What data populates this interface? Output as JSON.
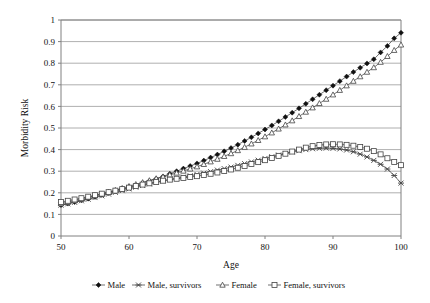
{
  "chart_data": {
    "type": "line",
    "title": "",
    "xlabel": "Age",
    "ylabel": "Morbidity Risk",
    "xlim": [
      50,
      100
    ],
    "ylim": [
      0,
      1
    ],
    "xticks": [
      50,
      60,
      70,
      80,
      90,
      100
    ],
    "yticks": [
      0,
      0.1,
      0.2,
      0.3,
      0.4,
      0.5,
      0.6,
      0.7,
      0.8,
      0.9,
      1
    ],
    "xtick_labels": [
      "50",
      "60",
      "70",
      "80",
      "90",
      "100"
    ],
    "ytick_labels": [
      "0",
      "0.1",
      "0.2",
      "0.3",
      "0.4",
      "0.5",
      "0.6",
      "0.7",
      "0.8",
      "0.9",
      "1"
    ],
    "grid": "horizontal",
    "legend_position": "bottom",
    "x": [
      50,
      51,
      52,
      53,
      54,
      55,
      56,
      57,
      58,
      59,
      60,
      61,
      62,
      63,
      64,
      65,
      66,
      67,
      68,
      69,
      70,
      71,
      72,
      73,
      74,
      75,
      76,
      77,
      78,
      79,
      80,
      81,
      82,
      83,
      84,
      85,
      86,
      87,
      88,
      89,
      90,
      91,
      92,
      93,
      94,
      95,
      96,
      97,
      98,
      99,
      100
    ],
    "series": [
      {
        "name": "Male",
        "marker": "filled-diamond",
        "values": [
          0.143,
          0.15,
          0.157,
          0.165,
          0.173,
          0.181,
          0.19,
          0.199,
          0.208,
          0.217,
          0.226,
          0.235,
          0.245,
          0.255,
          0.265,
          0.276,
          0.288,
          0.3,
          0.312,
          0.324,
          0.336,
          0.349,
          0.363,
          0.377,
          0.392,
          0.407,
          0.423,
          0.44,
          0.457,
          0.475,
          0.493,
          0.512,
          0.531,
          0.551,
          0.571,
          0.591,
          0.612,
          0.633,
          0.654,
          0.675,
          0.696,
          0.717,
          0.738,
          0.759,
          0.779,
          0.799,
          0.818,
          0.85,
          0.88,
          0.915,
          0.941
        ]
      },
      {
        "name": "Male, survivors",
        "marker": "cross",
        "values": [
          0.143,
          0.149,
          0.156,
          0.163,
          0.17,
          0.178,
          0.186,
          0.194,
          0.202,
          0.21,
          0.218,
          0.226,
          0.234,
          0.241,
          0.248,
          0.255,
          0.261,
          0.267,
          0.273,
          0.279,
          0.285,
          0.291,
          0.298,
          0.305,
          0.312,
          0.319,
          0.327,
          0.335,
          0.343,
          0.351,
          0.359,
          0.367,
          0.375,
          0.382,
          0.389,
          0.395,
          0.4,
          0.404,
          0.406,
          0.407,
          0.406,
          0.403,
          0.398,
          0.39,
          0.379,
          0.366,
          0.35,
          0.332,
          0.31,
          0.28,
          0.245
        ]
      },
      {
        "name": "Female",
        "marker": "open-triangle",
        "values": [
          0.15,
          0.157,
          0.164,
          0.171,
          0.179,
          0.187,
          0.195,
          0.203,
          0.212,
          0.221,
          0.23,
          0.239,
          0.248,
          0.257,
          0.266,
          0.274,
          0.283,
          0.292,
          0.301,
          0.311,
          0.321,
          0.332,
          0.344,
          0.356,
          0.369,
          0.382,
          0.396,
          0.411,
          0.427,
          0.443,
          0.46,
          0.478,
          0.496,
          0.515,
          0.534,
          0.554,
          0.574,
          0.594,
          0.614,
          0.634,
          0.654,
          0.675,
          0.696,
          0.717,
          0.738,
          0.759,
          0.78,
          0.805,
          0.832,
          0.86,
          0.885
        ]
      },
      {
        "name": "Female, survivors",
        "marker": "open-square",
        "values": [
          0.157,
          0.163,
          0.169,
          0.175,
          0.182,
          0.189,
          0.196,
          0.203,
          0.21,
          0.217,
          0.224,
          0.231,
          0.238,
          0.244,
          0.25,
          0.256,
          0.261,
          0.265,
          0.269,
          0.273,
          0.277,
          0.282,
          0.288,
          0.294,
          0.301,
          0.308,
          0.316,
          0.324,
          0.333,
          0.342,
          0.351,
          0.361,
          0.371,
          0.381,
          0.391,
          0.4,
          0.409,
          0.416,
          0.421,
          0.424,
          0.425,
          0.424,
          0.422,
          0.418,
          0.412,
          0.404,
          0.393,
          0.378,
          0.36,
          0.343,
          0.328
        ]
      }
    ]
  },
  "legend": {
    "items": [
      {
        "label": "Male"
      },
      {
        "label": "Male, survivors"
      },
      {
        "label": "Female"
      },
      {
        "label": "Female, survivors"
      }
    ]
  },
  "colors": {
    "axis": "#808080",
    "grid": "#9a9a9a",
    "line": "#333333",
    "marker_fill": "#111111",
    "marker_open": "#ffffff",
    "text": "#111111",
    "background": "#ffffff"
  }
}
